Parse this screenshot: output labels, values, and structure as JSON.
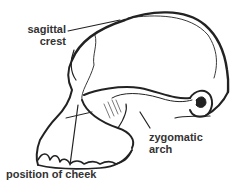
{
  "diagram": {
    "labels": {
      "sagittal_crest": [
        "sagittal",
        "crest"
      ],
      "zygomatic_arch": [
        "zygomatic",
        "arch"
      ],
      "cheek": "position of cheek"
    },
    "colors": {
      "ink": "#222222",
      "label": "#333333",
      "background": "#ffffff"
    }
  }
}
